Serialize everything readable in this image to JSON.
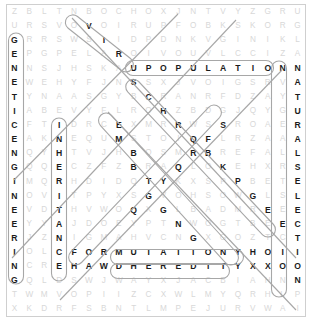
{
  "puzzle": {
    "type": "word-search",
    "columns": 20,
    "rows": 22,
    "found_color": "#1b1b1b",
    "filler_color": "#d8d8d8",
    "highlight_color": "#9b9b9b",
    "background": "#ffffff",
    "found_words": [
      "GENETIC ENGINEERING",
      "NATURAL SELECTION",
      "VIRUS",
      "POPULATION",
      "CHROMOSOME",
      "INHERITANCE",
      "EMBRYOLOGY",
      "MEIOSIS",
      "MUTATION",
      "HEREDITY"
    ],
    "rows_letters": [
      [
        "Z",
        "B",
        "L",
        "T",
        "N",
        "B",
        "O",
        "C",
        "H",
        "O",
        "X",
        "J",
        "N",
        "T",
        "V",
        "Y",
        "Z",
        "G",
        "R",
        "U"
      ],
      [
        "U",
        "R",
        "S",
        "V",
        "O",
        "V",
        "O",
        "I",
        "R",
        "U",
        "P",
        "F",
        "O",
        "B",
        "K",
        "S",
        "K",
        "O",
        "R",
        "G"
      ],
      [
        "G",
        "R",
        "R",
        "S",
        "W",
        "S",
        "I",
        "I",
        "D",
        "P",
        "D",
        "N",
        "K",
        "V",
        "G",
        "I",
        "N",
        "I",
        "K",
        "L"
      ],
      [
        "E",
        "P",
        "G",
        "P",
        "E",
        "L",
        "A",
        "R",
        "O",
        "I",
        "V",
        "O",
        "U",
        "V",
        "L",
        "C",
        "C",
        "I",
        "Z",
        "A"
      ],
      [
        "N",
        "N",
        "S",
        "J",
        "H",
        "S",
        "K",
        "A",
        "U",
        "P",
        "O",
        "P",
        "U",
        "L",
        "A",
        "T",
        "I",
        "O",
        "N",
        "N"
      ],
      [
        "E",
        "W",
        "E",
        "H",
        "Y",
        "F",
        "J",
        "N",
        "S",
        "S",
        "X",
        "J",
        "V",
        "O",
        "I",
        "G",
        "S",
        "R",
        "V",
        "A"
      ],
      [
        "T",
        "Y",
        "N",
        "A",
        "A",
        "S",
        "G",
        "Y",
        "B",
        "C",
        "R",
        "A",
        "N",
        "R",
        "F",
        "D",
        "Z",
        "A",
        "Y",
        "T"
      ],
      [
        "I",
        "A",
        "B",
        "E",
        "V",
        "Y",
        "F",
        "L",
        "R",
        "O",
        "H",
        "Z",
        "B",
        "D",
        "G",
        "J",
        "Q",
        "Y",
        "G",
        "U"
      ],
      [
        "C",
        "F",
        "T",
        "I",
        "D",
        "R",
        "C",
        "E",
        "X",
        "M",
        "R",
        "R",
        "W",
        "S",
        "S",
        "R",
        "O",
        "A",
        "E",
        "R"
      ],
      [
        "E",
        "A",
        "K",
        "N",
        "E",
        "Q",
        "U",
        "M",
        "S",
        "T",
        "O",
        "I",
        "Q",
        "F",
        "L",
        "R",
        "Z",
        "A",
        "A",
        "A"
      ],
      [
        "N",
        "Q",
        "Y",
        "H",
        "T",
        "V",
        "J",
        "H",
        "B",
        "O",
        "S",
        "M",
        "R",
        "B",
        "R",
        "E",
        "F",
        "A",
        "L",
        "L"
      ],
      [
        "G",
        "Q",
        "Q",
        "E",
        "C",
        "Z",
        "F",
        "Z",
        "B",
        "R",
        "A",
        "Q",
        "L",
        "O",
        "K",
        "E",
        "H",
        "X",
        "R",
        "S"
      ],
      [
        "I",
        "M",
        "Q",
        "R",
        "H",
        "D",
        "I",
        "D",
        "Q",
        "T",
        "Y",
        "K",
        "X",
        "S",
        "P",
        "P",
        "B",
        "E",
        "T",
        "E"
      ],
      [
        "N",
        "O",
        "V",
        "I",
        "T",
        "P",
        "Y",
        "X",
        "S",
        "G",
        "V",
        "O",
        "H",
        "S",
        "O",
        "W",
        "G",
        "L",
        "S",
        "L"
      ],
      [
        "E",
        "V",
        "D",
        "T",
        "H",
        "V",
        "W",
        "O",
        "Q",
        "X",
        "G",
        "L",
        "B",
        "A",
        "D",
        "M",
        "R",
        "E",
        "E",
        "E"
      ],
      [
        "E",
        "Y",
        "Y",
        "A",
        "J",
        "D",
        "O",
        "E",
        "Y",
        "P",
        "T",
        "N",
        "W",
        "O",
        "G",
        "T",
        "B",
        "E",
        "E",
        "C"
      ],
      [
        "R",
        "J",
        "Z",
        "N",
        "I",
        "G",
        "M",
        "A",
        "H",
        "V",
        "C",
        "N",
        "G",
        "X",
        "G",
        "O",
        "Z",
        "T",
        "C",
        "T"
      ],
      [
        "I",
        "O",
        "L",
        "C",
        "F",
        "O",
        "R",
        "M",
        "U",
        "T",
        "A",
        "T",
        "I",
        "O",
        "N",
        "Y",
        "H",
        "O",
        "I",
        "I"
      ],
      [
        "N",
        "C",
        "R",
        "E",
        "H",
        "A",
        "W",
        "D",
        "H",
        "E",
        "R",
        "E",
        "D",
        "I",
        "T",
        "Y",
        "X",
        "X",
        "O",
        "O"
      ],
      [
        "G",
        "Q",
        "L",
        "D",
        "S",
        "W",
        "J",
        "W",
        "A",
        "Y",
        "X",
        "J",
        "A",
        "C",
        "B",
        "I",
        "A",
        "H",
        "N",
        "N"
      ],
      [
        "T",
        "W",
        "M",
        "V",
        "O",
        "P",
        "I",
        "I",
        "Z",
        "C",
        "X",
        "W",
        "L",
        "M",
        "Y",
        "Q",
        "R",
        "H",
        "L",
        "P"
      ],
      [
        "X",
        "K",
        "D",
        "R",
        "F",
        "S",
        "B",
        "N",
        "T",
        "L",
        "M",
        "P",
        "E",
        "J",
        "U",
        "R",
        "V",
        "W",
        "A",
        "I"
      ]
    ],
    "found_cells": [
      [
        2,
        0
      ],
      [
        3,
        0
      ],
      [
        4,
        0
      ],
      [
        5,
        0
      ],
      [
        6,
        0
      ],
      [
        7,
        0
      ],
      [
        8,
        0
      ],
      [
        9,
        0
      ],
      [
        10,
        0
      ],
      [
        11,
        0
      ],
      [
        12,
        0
      ],
      [
        13,
        0
      ],
      [
        14,
        0
      ],
      [
        15,
        0
      ],
      [
        16,
        0
      ],
      [
        17,
        0
      ],
      [
        18,
        0
      ],
      [
        19,
        0
      ],
      [
        1,
        5
      ],
      [
        2,
        6
      ],
      [
        3,
        7
      ],
      [
        4,
        8
      ],
      [
        5,
        8
      ],
      [
        4,
        9
      ],
      [
        4,
        10
      ],
      [
        4,
        11
      ],
      [
        4,
        12
      ],
      [
        4,
        13
      ],
      [
        4,
        14
      ],
      [
        4,
        15
      ],
      [
        4,
        16
      ],
      [
        4,
        17
      ],
      [
        4,
        18
      ],
      [
        6,
        9
      ],
      [
        7,
        10
      ],
      [
        8,
        11
      ],
      [
        9,
        12
      ],
      [
        10,
        13
      ],
      [
        11,
        14
      ],
      [
        12,
        15
      ],
      [
        13,
        16
      ],
      [
        14,
        17
      ],
      [
        15,
        18
      ],
      [
        8,
        3
      ],
      [
        9,
        3
      ],
      [
        10,
        3
      ],
      [
        11,
        3
      ],
      [
        12,
        3
      ],
      [
        13,
        3
      ],
      [
        14,
        3
      ],
      [
        15,
        3
      ],
      [
        16,
        3
      ],
      [
        17,
        3
      ],
      [
        18,
        3
      ],
      [
        8,
        7
      ],
      [
        9,
        7
      ],
      [
        10,
        8
      ],
      [
        11,
        8
      ],
      [
        12,
        9
      ],
      [
        13,
        9
      ],
      [
        14,
        10
      ],
      [
        15,
        11
      ],
      [
        16,
        12
      ],
      [
        17,
        12
      ],
      [
        8,
        14
      ],
      [
        9,
        13
      ],
      [
        10,
        12
      ],
      [
        11,
        11
      ],
      [
        12,
        10
      ],
      [
        13,
        9
      ],
      [
        14,
        8
      ],
      [
        17,
        7
      ],
      [
        17,
        8
      ],
      [
        17,
        9
      ],
      [
        17,
        10
      ],
      [
        17,
        11
      ],
      [
        17,
        12
      ],
      [
        17,
        13
      ],
      [
        17,
        14
      ],
      [
        17,
        15
      ],
      [
        18,
        18
      ],
      [
        18,
        19
      ],
      [
        4,
        19
      ],
      [
        5,
        19
      ],
      [
        6,
        19
      ],
      [
        7,
        19
      ],
      [
        8,
        19
      ],
      [
        9,
        19
      ],
      [
        10,
        19
      ],
      [
        11,
        19
      ],
      [
        12,
        19
      ],
      [
        13,
        19
      ],
      [
        14,
        19
      ],
      [
        15,
        19
      ],
      [
        16,
        19
      ],
      [
        17,
        19
      ],
      [
        18,
        19
      ],
      [
        19,
        19
      ],
      [
        17,
        4
      ],
      [
        17,
        5
      ],
      [
        17,
        6
      ],
      [
        17,
        7
      ],
      [
        17,
        8
      ],
      [
        17,
        9
      ],
      [
        17,
        10
      ],
      [
        17,
        11
      ],
      [
        17,
        12
      ],
      [
        17,
        13
      ],
      [
        17,
        14
      ],
      [
        17,
        15
      ],
      [
        17,
        16
      ],
      [
        17,
        17
      ],
      [
        17,
        18
      ],
      [
        17,
        19
      ],
      [
        18,
        4
      ],
      [
        18,
        5
      ],
      [
        18,
        6
      ],
      [
        18,
        7
      ],
      [
        18,
        8
      ],
      [
        18,
        9
      ],
      [
        18,
        10
      ],
      [
        18,
        11
      ],
      [
        18,
        12
      ],
      [
        18,
        13
      ],
      [
        18,
        14
      ],
      [
        18,
        15
      ],
      [
        18,
        16
      ],
      [
        18,
        17
      ],
      [
        18,
        18
      ],
      [
        18,
        19
      ]
    ]
  }
}
